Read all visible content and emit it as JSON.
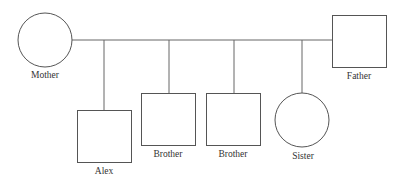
{
  "diagram": {
    "type": "pedigree",
    "parents": [
      {
        "id": "mother",
        "label": "Mother",
        "sex": "female",
        "shape": "circle"
      },
      {
        "id": "father",
        "label": "Father",
        "sex": "male",
        "shape": "square"
      }
    ],
    "children": [
      {
        "id": "alex",
        "label": "Alex",
        "sex": "male",
        "shape": "square"
      },
      {
        "id": "brother1",
        "label": "Brother",
        "sex": "male",
        "shape": "square"
      },
      {
        "id": "brother2",
        "label": "Brother",
        "sex": "male",
        "shape": "square"
      },
      {
        "id": "sister",
        "label": "Sister",
        "sex": "female",
        "shape": "circle"
      }
    ]
  }
}
